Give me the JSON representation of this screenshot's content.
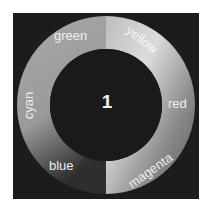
{
  "wheel": {
    "center_label": "1",
    "segments": [
      {
        "name": "yellow",
        "label": "yellow"
      },
      {
        "name": "red",
        "label": "red"
      },
      {
        "name": "magenta",
        "label": "magenta"
      },
      {
        "name": "blue",
        "label": "blue"
      },
      {
        "name": "cyan",
        "label": "cyan"
      },
      {
        "name": "green",
        "label": "green"
      }
    ],
    "colors": {
      "background": "#1c1c1c",
      "ring_light": "#d8d8d8",
      "ring_mid": "#9a9a9a",
      "ring_dark": "#3a3a3a",
      "text": "#eeeeee"
    }
  }
}
